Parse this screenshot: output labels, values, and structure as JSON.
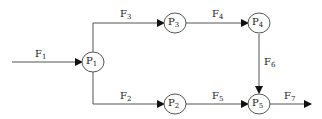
{
  "nodes": [
    {
      "id": "P1",
      "base": "P",
      "sub": "1"
    },
    {
      "id": "P2",
      "base": "P",
      "sub": "2"
    },
    {
      "id": "P3",
      "base": "P",
      "sub": "3"
    },
    {
      "id": "P4",
      "base": "P",
      "sub": "4"
    },
    {
      "id": "P5",
      "base": "P",
      "sub": "5"
    }
  ],
  "flows": [
    {
      "id": "F1",
      "base": "F",
      "sub": "1",
      "from": "",
      "to": "P1"
    },
    {
      "id": "F2",
      "base": "F",
      "sub": "2",
      "from": "P1",
      "to": "P2"
    },
    {
      "id": "F3",
      "base": "F",
      "sub": "3",
      "from": "P1",
      "to": "P3"
    },
    {
      "id": "F4",
      "base": "F",
      "sub": "4",
      "from": "P3",
      "to": "P4"
    },
    {
      "id": "F5",
      "base": "F",
      "sub": "5",
      "from": "P2",
      "to": "P5"
    },
    {
      "id": "F6",
      "base": "F",
      "sub": "6",
      "from": "P4",
      "to": "P5"
    },
    {
      "id": "F7",
      "base": "F",
      "sub": "7",
      "from": "P5",
      "to": ""
    }
  ],
  "colors": {
    "line": "#555555",
    "text": "#222222"
  }
}
